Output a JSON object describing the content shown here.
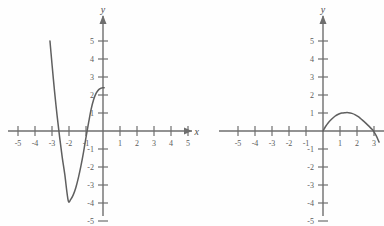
{
  "figure": {
    "background_color": "#fefefe",
    "curve_color": "#5f5f5f",
    "axis_color": "#6e6e6e",
    "label_color": "#5a5a5a",
    "panel_count": 2
  },
  "chart_data": [
    {
      "type": "line",
      "title": "",
      "subtitle": "",
      "panel": "left",
      "xlabel": "x",
      "ylabel": "y",
      "xlim": [
        -5.8,
        5.8
      ],
      "ylim": [
        -5.6,
        5.6
      ],
      "grid": false,
      "legend": null,
      "x_axis_arrow": true,
      "y_axis_arrow": true,
      "x_ticks": [
        -5,
        -4,
        -3,
        -2,
        -1,
        1,
        2,
        3,
        4,
        5
      ],
      "x_tick_labels": [
        "-5",
        "-4",
        "-3",
        "-2",
        "-1",
        "1",
        "2",
        "3",
        "4",
        "5"
      ],
      "y_ticks": [
        -5,
        -4,
        -3,
        -2,
        -1,
        1,
        2,
        3,
        4,
        5
      ],
      "y_tick_labels": [
        "-5",
        "-4",
        "-3",
        "-2",
        "-1",
        "1",
        "2",
        "3",
        "4",
        "5"
      ],
      "series": [
        {
          "name": "cubic curve",
          "description": "cubic descending from upper left, local minimum near (-2.05, -3.85), rising to about (0, 2.4)",
          "x": [
            -3.12,
            -3.05,
            -2.95,
            -2.85,
            -2.7,
            -2.55,
            -2.4,
            -2.25,
            -2.05,
            -1.9,
            -1.75,
            -1.6,
            -1.45,
            -1.3,
            -1.15,
            -1.0,
            -0.85,
            -0.7,
            -0.55,
            -0.4,
            -0.25,
            -0.1,
            0.0,
            0.07
          ],
          "y": [
            5.0,
            4.25,
            3.2,
            2.2,
            0.85,
            -0.35,
            -1.45,
            -2.4,
            -3.85,
            -3.8,
            -3.55,
            -3.15,
            -2.6,
            -1.95,
            -1.2,
            -0.35,
            0.45,
            1.2,
            1.75,
            2.1,
            2.3,
            2.38,
            2.4,
            2.4
          ]
        }
      ],
      "annotations": [
        {
          "text": "x-intercept",
          "x": -3.0,
          "y": 0
        },
        {
          "text": "x-intercept",
          "x": -1.05,
          "y": 0
        },
        {
          "text": "local minimum",
          "x": -2.05,
          "y": -3.85
        },
        {
          "text": "y-intercept",
          "x": 0,
          "y": 2.4
        }
      ]
    },
    {
      "type": "line",
      "title": "",
      "subtitle": "",
      "panel": "right",
      "xlabel": "",
      "ylabel": "y",
      "xlim": [
        -5.8,
        3.6
      ],
      "ylim": [
        -5.6,
        5.6
      ],
      "grid": false,
      "legend": null,
      "x_axis_arrow": false,
      "y_axis_arrow": true,
      "x_ticks": [
        -5,
        -4,
        -3,
        -2,
        -1,
        1,
        2,
        3
      ],
      "x_tick_labels": [
        "-5",
        "-4",
        "-3",
        "-2",
        "-1",
        "1",
        "2",
        "3"
      ],
      "y_ticks": [
        -5,
        -4,
        -3,
        -2,
        -1,
        1,
        2,
        3,
        4,
        5
      ],
      "y_tick_labels": [
        "-5",
        "-4",
        "-3",
        "-2",
        "-1",
        "1",
        "2",
        "3",
        "4",
        "5"
      ],
      "series": [
        {
          "name": "downward arch",
          "description": "curve rising from the origin to a maximum near (1.5, 1.02) and falling through the x-axis near x = 3",
          "x": [
            0.0,
            0.15,
            0.3,
            0.5,
            0.7,
            0.9,
            1.1,
            1.3,
            1.5,
            1.7,
            1.9,
            2.1,
            2.3,
            2.5,
            2.7,
            2.9,
            3.0,
            3.15,
            3.3
          ],
          "y": [
            0.0,
            0.25,
            0.45,
            0.65,
            0.82,
            0.93,
            1.0,
            1.02,
            1.02,
            0.98,
            0.9,
            0.78,
            0.62,
            0.45,
            0.27,
            0.08,
            -0.05,
            -0.3,
            -0.62
          ]
        }
      ],
      "annotations": [
        {
          "text": "origin intercept",
          "x": 0,
          "y": 0
        },
        {
          "text": "maximum",
          "x": 1.45,
          "y": 1.02
        },
        {
          "text": "x-intercept",
          "x": 3.0,
          "y": 0
        }
      ]
    }
  ],
  "left_panel": {
    "y_axis_label": "y",
    "x_axis_label": "x",
    "x_tick_labels": [
      "-5",
      "-4",
      "-3",
      "-2",
      "-1",
      "1",
      "2",
      "3",
      "4",
      "5"
    ],
    "y_tick_labels": [
      "5",
      "4",
      "3",
      "2",
      "1",
      "-1",
      "-2",
      "-3",
      "-4",
      "-5"
    ]
  },
  "right_panel": {
    "y_axis_label": "y",
    "x_axis_label": "",
    "x_tick_labels": [
      "-5",
      "-4",
      "-3",
      "-2",
      "-1",
      "1",
      "2",
      "3"
    ],
    "y_tick_labels": [
      "5",
      "4",
      "3",
      "2",
      "1",
      "-1",
      "-2",
      "-3",
      "-4",
      "-5"
    ]
  }
}
